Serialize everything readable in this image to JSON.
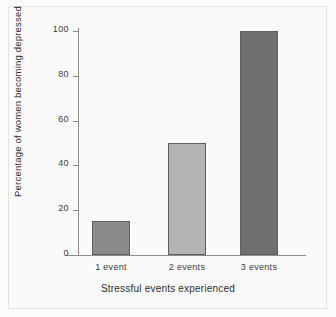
{
  "chart_data": {
    "type": "bar",
    "title": "",
    "categories": [
      "1 event",
      "2 events",
      "3 events"
    ],
    "values": [
      15,
      50,
      100
    ],
    "series": [
      {
        "name": "Percentage of women becoming depressed",
        "values": [
          15,
          50,
          100
        ]
      }
    ],
    "xlabel": "Stressful events experienced",
    "ylabel": "Percentage of women becoming depressed",
    "ylim": [
      0,
      100
    ],
    "yticks": [
      0,
      20,
      40,
      60,
      80,
      100
    ],
    "ytick_labels": [
      "0",
      "20",
      "40",
      "60",
      "80",
      "100"
    ],
    "grid": false,
    "legend": false,
    "bar_colors": [
      "#8a8a8a",
      "#b3b3b3",
      "#6f6f6f"
    ],
    "bar_edge_color": "#5e5e5e",
    "axis_color": "#8d8d8d",
    "background_color": "#fafafa",
    "frame_color": "#e2e2e2"
  }
}
